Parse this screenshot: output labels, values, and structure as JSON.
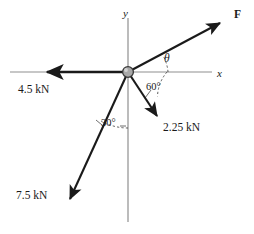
{
  "figure": {
    "type": "free-body-force-diagram",
    "width": 254,
    "height": 234,
    "background_color": "#ffffff",
    "ink_color": "#1a1a1a",
    "axis_color": "#8a8a8a",
    "origin_fill_color": "#a6a6a6",
    "origin_stroke_color": "#3c3c3c"
  },
  "axes": {
    "x_label": "x",
    "y_label": "y",
    "x_label_pos": {
      "x": 217,
      "y": 68
    },
    "y_label_pos": {
      "x": 123,
      "y": 8
    },
    "x_axis": {
      "x1": 10,
      "y1": 72,
      "x2": 212,
      "y2": 72
    },
    "y_axis": {
      "x1": 128,
      "y1": 18,
      "x2": 128,
      "y2": 222
    }
  },
  "origin": {
    "x": 128,
    "y": 72,
    "radius": 5.5,
    "label": "origin-joint"
  },
  "vectors": [
    {
      "id": "force-F",
      "label": "F",
      "label_style": "bold",
      "magnitude_text": "F",
      "tail": {
        "x": 128,
        "y": 72
      },
      "tip": {
        "x": 227,
        "y": 19
      },
      "label_pos": {
        "x": 234,
        "y": 9
      },
      "direction": "up-right",
      "angle_from_positive_x_deg": 28,
      "known": false
    },
    {
      "id": "force-4p5",
      "label": "4.5 kN",
      "label_style": "plain",
      "magnitude_text": "4.5 kN",
      "tail": {
        "x": 128,
        "y": 72
      },
      "tip": {
        "x": 40,
        "y": 72
      },
      "label_pos": {
        "x": 18,
        "y": 84
      },
      "direction": "left",
      "angle_from_positive_x_deg": 180,
      "known": true
    },
    {
      "id": "force-2p25",
      "label": "2.25 kN",
      "label_style": "plain",
      "magnitude_text": "2.25 kN",
      "tail": {
        "x": 128,
        "y": 72
      },
      "tip": {
        "x": 161,
        "y": 123
      },
      "label_pos": {
        "x": 163,
        "y": 122
      },
      "direction": "down-right",
      "angle_from_positive_x_deg": -60,
      "known": true
    },
    {
      "id": "force-7p5",
      "label": "7.5 kN",
      "label_style": "plain",
      "magnitude_text": "7.5 kN",
      "tail": {
        "x": 128,
        "y": 72
      },
      "tip": {
        "x": 66,
        "y": 206
      },
      "label_pos": {
        "x": 16,
        "y": 190
      },
      "direction": "down-left",
      "angle_from_negative_y_deg": 30,
      "known": true
    }
  ],
  "angles": [
    {
      "id": "angle-theta",
      "label": "θ",
      "label_style": "italic",
      "label_pos": {
        "x": 164,
        "y": 53
      },
      "between": [
        "positive-x-axis",
        "force-F"
      ],
      "value": null
    },
    {
      "id": "angle-60",
      "label": "60°",
      "label_style": "plain",
      "label_pos": {
        "x": 146,
        "y": 82
      },
      "between": [
        "positive-x-axis",
        "force-2p25"
      ],
      "value": 60
    },
    {
      "id": "angle-30",
      "label": "30°",
      "label_style": "plain",
      "label_pos": {
        "x": 101,
        "y": 118
      },
      "between": [
        "negative-y-axis",
        "force-7p5"
      ],
      "value": 30
    }
  ],
  "leaders": [
    {
      "id": "leader-60",
      "from": {
        "x": 150,
        "y": 92
      },
      "to": {
        "x": 143,
        "y": 101
      }
    },
    {
      "id": "leader-30",
      "from": {
        "x": 103,
        "y": 124
      },
      "to": {
        "x": 96,
        "y": 120
      }
    },
    {
      "id": "leader-30-right",
      "from": {
        "x": 119,
        "y": 124
      },
      "to": {
        "x": 124,
        "y": 124
      }
    }
  ]
}
